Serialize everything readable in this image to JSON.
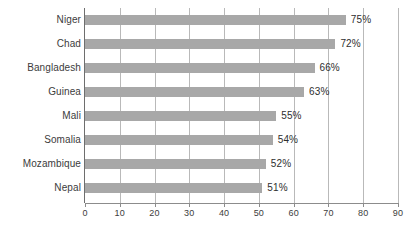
{
  "chart_data": {
    "type": "bar",
    "orientation": "horizontal",
    "title": "",
    "xlabel": "",
    "ylabel": "",
    "xlim": [
      0,
      90
    ],
    "grid": true,
    "legend": false,
    "categories": [
      "Niger",
      "Chad",
      "Bangladesh",
      "Guinea",
      "Mali",
      "Somalia",
      "Mozambique",
      "Nepal"
    ],
    "values": [
      75,
      72,
      66,
      63,
      55,
      54,
      52,
      51
    ],
    "value_labels": [
      "75%",
      "72%",
      "66%",
      "63%",
      "55%",
      "54%",
      "52%",
      "51%"
    ],
    "xticks": [
      0,
      10,
      20,
      30,
      40,
      50,
      60,
      70,
      80,
      90
    ],
    "xtick_labels": [
      "0",
      "10",
      "20",
      "30",
      "40",
      "50",
      "60",
      "70",
      "80",
      "90"
    ],
    "bar_color": "#a8a8a8",
    "gridline_color": "#b9b9b9",
    "axis_color": "#6e6e6e",
    "background_color": "#ffffff"
  },
  "caption": {
    "text": ""
  }
}
